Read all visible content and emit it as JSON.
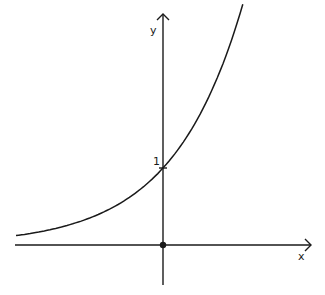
{
  "chart_data": {
    "type": "line",
    "title": "",
    "xlabel": "x",
    "ylabel": "y",
    "function": "y = e^x",
    "xlim": [
      -2.1,
      1.15
    ],
    "ylim": [
      0,
      3
    ],
    "x_range_plotted": [
      -2.1,
      1.14
    ],
    "annotations": [
      {
        "label": "1",
        "x": 0,
        "y": 1,
        "note": "y-intercept"
      },
      {
        "label": "origin",
        "x": 0,
        "y": 0,
        "marker": "dot"
      }
    ],
    "grid": false,
    "series": [
      {
        "name": "exponential curve",
        "x": [
          -2.1,
          -1.5,
          -1,
          -0.5,
          0,
          0.5,
          1,
          1.14
        ],
        "values": [
          0.12,
          0.22,
          0.37,
          0.61,
          1,
          1.65,
          2.72,
          3.13
        ]
      }
    ]
  },
  "labels": {
    "x_axis": "x",
    "y_axis": "y",
    "intercept": "1"
  },
  "colors": {
    "ink": "#1a1a1a",
    "background": "#ffffff"
  }
}
